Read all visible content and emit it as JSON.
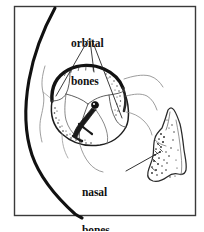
{
  "figure": {
    "kind": "anatomical-line-drawing",
    "background_color": "#ffffff",
    "ink_color": "#1a1a1a",
    "frame": {
      "present": true,
      "color": "#3a3a3a",
      "x": 14,
      "y": 6,
      "width": 182,
      "height": 210
    },
    "labels": [
      {
        "id": "orbital",
        "line1": "orbital",
        "line2": "bones",
        "x": 71,
        "y": 12,
        "leader_count": 3
      },
      {
        "id": "nasal",
        "line1": "nasal",
        "line2": "bones",
        "x": 82,
        "y": 161,
        "leader_count": 1
      }
    ],
    "structures": [
      {
        "name": "head-profile-curve",
        "description": "thick curved skull and face outline sweeping from top center to bottom right"
      },
      {
        "name": "orbital-socket",
        "description": "rounded orbit with thick shaded superior rim and internal suture lines"
      },
      {
        "name": "optic-foramen",
        "description": "small dark filled circle near orbit center"
      },
      {
        "name": "nasal-bone-fragment",
        "description": "irregular elongated stippled bone at right side"
      }
    ]
  }
}
